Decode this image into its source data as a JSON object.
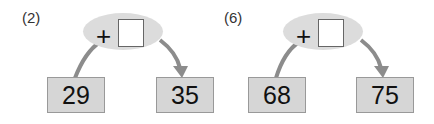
{
  "problems": [
    {
      "label": "(2)",
      "operator": "+",
      "start": "29",
      "end": "35",
      "answer": ""
    },
    {
      "label": "(6)",
      "operator": "+",
      "start": "68",
      "end": "75",
      "answer": ""
    }
  ],
  "colors": {
    "ellipse": "#dcdcdc",
    "box": "#d6d6d6",
    "arrow": "#8c8c8c"
  }
}
